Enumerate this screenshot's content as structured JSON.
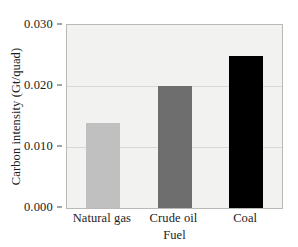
{
  "chart_data": {
    "type": "bar",
    "title": "",
    "subtitle": "",
    "xlabel": "Fuel",
    "ylabel": "Carbon intensity (Gt/quad)",
    "categories": [
      "Natural gas",
      "Crude oil",
      "Coal"
    ],
    "values": [
      0.014,
      0.02,
      0.025
    ],
    "series": [
      {
        "name": "Carbon intensity",
        "values": [
          0.014,
          0.02,
          0.025
        ]
      }
    ],
    "bar_colors": [
      "#c0c0c0",
      "#6e6e6e",
      "#000000"
    ],
    "ylim": [
      0.0,
      0.03
    ],
    "ytick_labels": [
      "0.000",
      "0.010",
      "0.020",
      "0.030"
    ],
    "ytick_values": [
      0.0,
      0.01,
      0.02,
      0.03
    ],
    "grid": true,
    "grid_axis": "y",
    "legend": "none",
    "annotations": [],
    "plot_background_color": "#f2f2f0",
    "frame_color": "#b9b9b7",
    "gridline_color": "#d9d9d6",
    "text_color": "#1b1b1b"
  }
}
